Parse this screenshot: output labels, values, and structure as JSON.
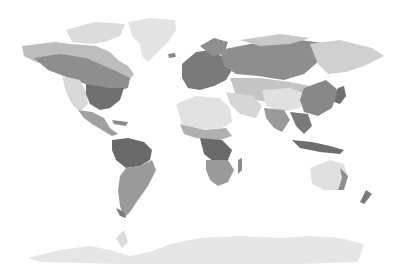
{
  "map": {
    "type": "world-climate-zones",
    "projection": "equirectangular-like",
    "style": "grayscale",
    "colors": {
      "background": "#ffffff",
      "ice": "#e6e6e6",
      "tundra": "#d4d4d4",
      "arid": "#e2e2e2",
      "semi_arid": "#c8c8c8",
      "temperate": "#a8a8a8",
      "continental": "#8e8e8e",
      "tropical": "#6a6a6a",
      "highland": "#bdbdbd"
    },
    "regions": [
      "north-america",
      "greenland",
      "south-america",
      "europe",
      "africa",
      "asia",
      "australia",
      "antarctica",
      "new-zealand",
      "indonesia",
      "japan",
      "madagascar"
    ]
  }
}
